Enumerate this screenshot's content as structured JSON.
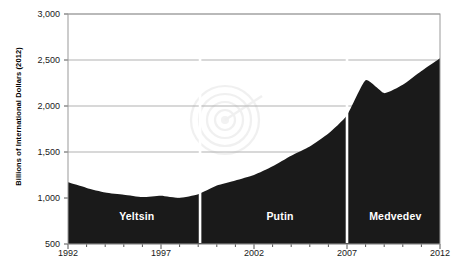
{
  "chart_data": {
    "type": "area",
    "title": "",
    "xlabel": "",
    "ylabel": "Billions of International Dollars (2012)",
    "grid": true,
    "legend": "none",
    "xlim": [
      1992,
      2012
    ],
    "ylim": [
      500,
      3000
    ],
    "y_ticks": [
      "3,000",
      "2,500",
      "2,000",
      "1,500",
      "1,000",
      "500"
    ],
    "y_tick_values": [
      3000,
      2500,
      2000,
      1500,
      1000,
      500
    ],
    "x_ticks": [
      "1992",
      "1997",
      "2002",
      "2007",
      "2012"
    ],
    "x_tick_values": [
      1992,
      1997,
      2002,
      2007,
      2012
    ],
    "x": [
      1992,
      1993,
      1994,
      1995,
      1996,
      1997,
      1998,
      1999,
      2000,
      2001,
      2002,
      2003,
      2004,
      2005,
      2006,
      2007,
      2008,
      2009,
      2010,
      2011,
      2012
    ],
    "values": [
      1170,
      1110,
      1060,
      1035,
      1010,
      1025,
      1000,
      1040,
      1135,
      1190,
      1250,
      1345,
      1460,
      1560,
      1700,
      1900,
      2280,
      2140,
      2230,
      2380,
      2520
    ],
    "series": [
      {
        "name": "Russian GDP",
        "color": "#1a1a1a",
        "values": [
          1170,
          1110,
          1060,
          1035,
          1010,
          1025,
          1000,
          1040,
          1135,
          1190,
          1250,
          1345,
          1460,
          1560,
          1700,
          1900,
          2280,
          2140,
          2230,
          2380,
          2520
        ]
      }
    ],
    "annotations": [
      {
        "label": "Yeltsin",
        "start": 1992,
        "end": 1999,
        "center_year": 1995.7
      },
      {
        "label": "Putin",
        "start": 1999,
        "end": 2007,
        "center_year": 2003.4
      },
      {
        "label": "Medvedev",
        "start": 2007,
        "end": 2012,
        "center_year": 2009.6
      }
    ],
    "dividers": [
      1999.1,
      2007.0
    ],
    "divider_color": "#ffffff",
    "area_color": "#1a1a1a",
    "grid_color": "#a8a8a8",
    "background": "#ffffff"
  },
  "axis": {
    "y_title": "Billions of International Dollars (2012)",
    "y_labels": [
      "3,000",
      "2,500",
      "2,000",
      "1,500",
      "1,000",
      "500"
    ],
    "x_labels": [
      "1992",
      "1997",
      "2002",
      "2007",
      "2012"
    ]
  },
  "eras": {
    "first": "Yeltsin",
    "second": "Putin",
    "third": "Medvedev"
  },
  "watermark": {
    "shape": "spiral-target"
  }
}
